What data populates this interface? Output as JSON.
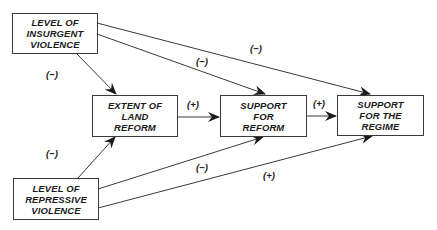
{
  "diagram": {
    "nodes": {
      "insurgent": {
        "lines": [
          "LEVEL OF",
          "INSURGENT",
          "VIOLENCE"
        ]
      },
      "land_reform": {
        "lines": [
          "EXTENT OF",
          "LAND",
          "REFORM"
        ]
      },
      "support_reform": {
        "lines": [
          "SUPPORT",
          "FOR",
          "REFORM"
        ]
      },
      "support_regime": {
        "lines": [
          "SUPPORT",
          "FOR THE",
          "REGIME"
        ]
      },
      "repressive": {
        "lines": [
          "LEVEL OF",
          "REPRESSIVE",
          "VIOLENCE"
        ]
      }
    },
    "edges": [
      {
        "from": "insurgent",
        "to": "land_reform",
        "sign": "(−)"
      },
      {
        "from": "insurgent",
        "to": "support_reform",
        "sign": "(−)"
      },
      {
        "from": "insurgent",
        "to": "support_regime",
        "sign": "(−)"
      },
      {
        "from": "land_reform",
        "to": "support_reform",
        "sign": "(+)"
      },
      {
        "from": "support_reform",
        "to": "support_regime",
        "sign": "(+)"
      },
      {
        "from": "repressive",
        "to": "land_reform",
        "sign": "(−)"
      },
      {
        "from": "repressive",
        "to": "support_reform",
        "sign": "(−)"
      },
      {
        "from": "repressive",
        "to": "support_regime",
        "sign": "(+)"
      }
    ]
  }
}
